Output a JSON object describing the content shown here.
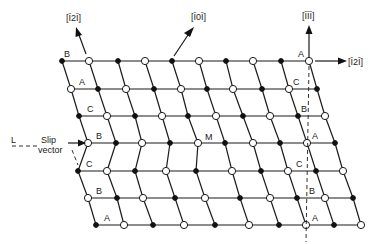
{
  "figure": {
    "direction_labels": {
      "d_121_left": "[Ī2Ī]",
      "d_101": "[Ī0Ī]",
      "d_111": "[ĪĪĪ]",
      "d_121_right": "[Ī2Ī]"
    },
    "slip": {
      "L_label": "L",
      "line1": "Slip",
      "line2": "vector"
    },
    "mirror_label": "M",
    "rows": [
      {
        "y": 61,
        "left_label": "B",
        "right_label": "A",
        "nodes": [
          [
            62,
            "f"
          ],
          [
            89,
            "o"
          ],
          [
            118,
            "f"
          ],
          [
            145,
            "o"
          ],
          [
            172,
            "f"
          ],
          [
            199,
            "o"
          ],
          [
            226,
            "f"
          ],
          [
            253,
            "o"
          ],
          [
            281,
            "f"
          ],
          [
            309,
            "o"
          ]
        ]
      },
      {
        "y": 89,
        "left_label": "A",
        "right_label": "C",
        "nodes": [
          [
            71,
            "o"
          ],
          [
            98,
            "f"
          ],
          [
            126,
            "o"
          ],
          [
            154,
            "f"
          ],
          [
            181,
            "o"
          ],
          [
            207,
            "f"
          ],
          [
            233,
            "o"
          ],
          [
            262,
            "f"
          ],
          [
            289,
            "o"
          ],
          [
            317,
            "f"
          ]
        ]
      },
      {
        "y": 116,
        "left_label": "C",
        "right_label": "B",
        "nodes": [
          [
            79,
            "f"
          ],
          [
            107,
            "o"
          ],
          [
            135,
            "f"
          ],
          [
            162,
            "o"
          ],
          [
            188,
            "f"
          ],
          [
            216,
            "o"
          ],
          [
            243,
            "f"
          ],
          [
            270,
            "o"
          ],
          [
            298,
            "f"
          ],
          [
            325,
            "o"
          ]
        ]
      },
      {
        "y": 143,
        "left_label": "B",
        "right_label": "A",
        "nodes": [
          [
            88,
            "o"
          ],
          [
            116,
            "f"
          ],
          [
            142,
            "o"
          ],
          [
            170,
            "f"
          ],
          [
            198,
            "o"
          ],
          [
            225,
            "f"
          ],
          [
            253,
            "o"
          ],
          [
            280,
            "f"
          ],
          [
            307,
            "o"
          ],
          [
            335,
            "f"
          ]
        ]
      },
      {
        "y": 171,
        "left_label": "C",
        "right_label": "C",
        "nodes": [
          [
            78,
            "f"
          ],
          [
            107,
            "o"
          ],
          [
            135,
            "f"
          ],
          [
            166,
            "o"
          ],
          [
            196,
            "f"
          ],
          [
            232,
            "o"
          ],
          [
            261,
            "f"
          ],
          [
            288,
            "o"
          ],
          [
            316,
            "f"
          ],
          [
            343,
            "o"
          ]
        ]
      },
      {
        "y": 198,
        "left_label": "B",
        "right_label": "B",
        "nodes": [
          [
            88,
            "o"
          ],
          [
            117,
            "f"
          ],
          [
            143,
            "o"
          ],
          [
            175,
            "f"
          ],
          [
            205,
            "o"
          ],
          [
            240,
            "f"
          ],
          [
            270,
            "o"
          ],
          [
            297,
            "f"
          ],
          [
            325,
            "o"
          ],
          [
            353,
            "f"
          ]
        ]
      },
      {
        "y": 225,
        "left_label": "A",
        "right_label": "A",
        "nodes": [
          [
            96,
            "f"
          ],
          [
            124,
            "o"
          ],
          [
            153,
            "f"
          ],
          [
            184,
            "o"
          ],
          [
            215,
            "f"
          ],
          [
            249,
            "o"
          ],
          [
            279,
            "f"
          ],
          [
            306,
            "o"
          ],
          [
            334,
            "f"
          ],
          [
            361,
            "o"
          ]
        ]
      }
    ],
    "colors": {
      "ink": "#1a1a1a",
      "paper": "#ffffff"
    }
  }
}
